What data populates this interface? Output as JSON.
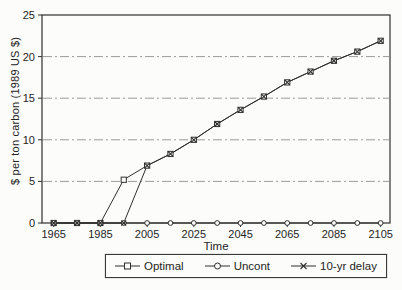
{
  "page": {
    "kind": "scanned line chart figure",
    "background": "#fcfcfb"
  },
  "colors": {
    "line": "#2f2f2f",
    "frame": "#2f2f2f",
    "grid": "#8f8f8f",
    "text": "#242424",
    "marker_fill": "#fcfcfb"
  },
  "chart": {
    "y_axis_title": "$ per ton carbon (1989 US $)",
    "x_axis_title": "Time",
    "legend": {
      "items": [
        {
          "label": "Optimal",
          "marker": "square"
        },
        {
          "label": "Uncont",
          "marker": "circle"
        },
        {
          "label": "10-yr delay",
          "marker": "x"
        }
      ]
    }
  },
  "chart_data": {
    "type": "line",
    "title": "",
    "xlabel": "Time",
    "ylabel": "$ per ton carbon (1989 US $)",
    "xlim": [
      1960,
      2109
    ],
    "ylim": [
      0,
      25
    ],
    "xticks": [
      1965,
      1985,
      2005,
      2025,
      2045,
      2065,
      2085,
      2105
    ],
    "yticks": [
      0,
      5,
      10,
      15,
      20,
      25
    ],
    "grid_values": [
      5,
      10,
      15,
      20
    ],
    "grid": "horizontal dashed",
    "legend_position": "bottom",
    "x": [
      1965,
      1975,
      1985,
      1995,
      2005,
      2015,
      2025,
      2035,
      2045,
      2055,
      2065,
      2075,
      2085,
      2095,
      2105
    ],
    "series": [
      {
        "name": "Optimal",
        "marker": "square",
        "values": [
          0,
          0,
          0,
          5.2,
          6.9,
          8.3,
          10.0,
          11.9,
          13.6,
          15.2,
          16.9,
          18.2,
          19.5,
          20.6,
          21.9
        ]
      },
      {
        "name": "Uncont",
        "marker": "circle",
        "values": [
          0,
          0,
          0,
          0,
          0,
          0,
          0,
          0,
          0,
          0,
          0,
          0,
          0,
          0,
          0
        ]
      },
      {
        "name": "10-yr delay",
        "marker": "x",
        "values": [
          0,
          0,
          0,
          0,
          6.9,
          8.3,
          10.0,
          11.9,
          13.6,
          15.2,
          16.9,
          18.2,
          19.5,
          20.6,
          21.9
        ]
      }
    ]
  }
}
